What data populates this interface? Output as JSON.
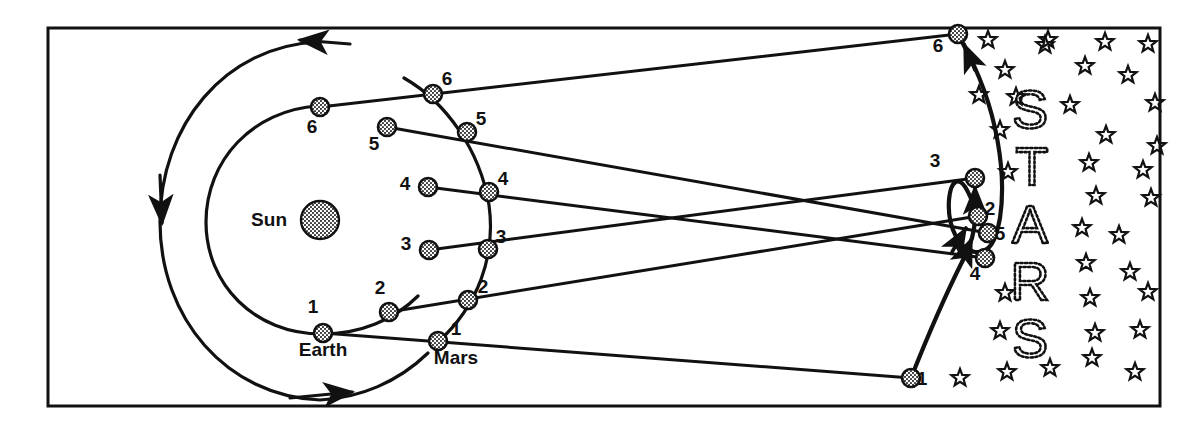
{
  "figure": {
    "title_visible": false,
    "frame": {
      "x": 48,
      "y": 28,
      "width": 1112,
      "height": 378,
      "stroke": "#111111",
      "stroke_width": 3,
      "fill": "#ffffff"
    },
    "colors": {
      "ink": "#111111",
      "body_fill": "#8c8c8c",
      "background": "#ffffff"
    }
  },
  "labels": {
    "sun": "Sun",
    "earth": "Earth",
    "mars": "Mars",
    "stars_word": [
      "S",
      "T",
      "A",
      "R",
      "S"
    ]
  },
  "sun": {
    "cx": 320,
    "cy": 220,
    "r": 19,
    "label_x": 287,
    "label_y": 226
  },
  "orbits": {
    "earth_orbit": {
      "cx": 320,
      "cy": 222,
      "rx": 145,
      "ry": 196,
      "note": "outer drawn arc - Earth path"
    },
    "mars_orbit": {
      "cx": 320,
      "cy": 222,
      "rx": 172,
      "ry": 200,
      "note": "inner-left large arc - Mars path"
    },
    "direction_arrows": [
      "top-left counterclockwise",
      "left-middle downward",
      "bottom rightward"
    ]
  },
  "earth_positions": [
    {
      "n": "1",
      "x": 323,
      "y": 333,
      "label_x": 313,
      "label_y": 313
    },
    {
      "n": "2",
      "x": 389,
      "y": 312,
      "label_x": 380,
      "label_y": 294
    },
    {
      "n": "3",
      "x": 429,
      "y": 250,
      "label_x": 406,
      "label_y": 250
    },
    {
      "n": "4",
      "x": 428,
      "y": 187,
      "label_x": 405,
      "label_y": 190
    },
    {
      "n": "5",
      "x": 387,
      "y": 127,
      "label_x": 374,
      "label_y": 150
    },
    {
      "n": "6",
      "x": 320,
      "y": 107,
      "label_x": 312,
      "label_y": 133
    }
  ],
  "mars_positions": [
    {
      "n": "1",
      "x": 438,
      "y": 341,
      "label_x": 456,
      "label_y": 335
    },
    {
      "n": "2",
      "x": 468,
      "y": 300,
      "label_x": 483,
      "label_y": 293
    },
    {
      "n": "3",
      "x": 488,
      "y": 249,
      "label_x": 501,
      "label_y": 243
    },
    {
      "n": "4",
      "x": 489,
      "y": 192,
      "label_x": 503,
      "label_y": 185
    },
    {
      "n": "5",
      "x": 467,
      "y": 132,
      "label_x": 481,
      "label_y": 125
    },
    {
      "n": "6",
      "x": 433,
      "y": 94,
      "label_x": 447,
      "label_y": 85
    }
  ],
  "apparent_positions": [
    {
      "n": "1",
      "x": 911,
      "y": 378,
      "filled": false,
      "label_x": 922,
      "label_y": 385
    },
    {
      "n": "2",
      "x": 978,
      "y": 216,
      "filled": false,
      "label_x": 990,
      "label_y": 215
    },
    {
      "n": "3",
      "x": 975,
      "y": 178,
      "filled": true,
      "label_x": 935,
      "label_y": 167
    },
    {
      "n": "4",
      "x": 985,
      "y": 258,
      "filled": true,
      "label_x": 975,
      "label_y": 280
    },
    {
      "n": "5",
      "x": 988,
      "y": 233,
      "filled": true,
      "label_x": 1000,
      "label_y": 240
    },
    {
      "n": "6",
      "x": 958,
      "y": 34,
      "filled": true,
      "label_x": 938,
      "label_y": 52
    }
  ],
  "sight_lines": [
    {
      "from": "earth-1",
      "to": "apparent-1",
      "x1": 323,
      "y1": 333,
      "x2": 911,
      "y2": 378
    },
    {
      "from": "earth-2",
      "to": "apparent-2",
      "x1": 389,
      "y1": 312,
      "x2": 978,
      "y2": 216
    },
    {
      "from": "earth-3",
      "to": "apparent-3",
      "x1": 429,
      "y1": 250,
      "x2": 975,
      "y2": 178
    },
    {
      "from": "earth-4",
      "to": "apparent-4",
      "x1": 428,
      "y1": 187,
      "x2": 985,
      "y2": 258
    },
    {
      "from": "earth-5",
      "to": "apparent-5",
      "x1": 387,
      "y1": 127,
      "x2": 988,
      "y2": 233
    },
    {
      "from": "earth-6",
      "to": "apparent-6",
      "x1": 320,
      "y1": 107,
      "x2": 958,
      "y2": 34
    }
  ],
  "apparent_path": {
    "label": "apparent path of Mars with retrograde loop",
    "d": "M 911,378 C 930,330 948,290 962,262 C 975,238 980,214 968,192 C 960,176 951,178 949,200 C 947,228 960,250 975,252 C 990,254 996,240 1000,218 C 1006,178 1000,110 962,42",
    "arrow_points": [
      "near 4 pointing up-right",
      "near 5 pointing up-right",
      "near 3 pointing up",
      "near 6 pointing up"
    ]
  },
  "stars_word_letters": [
    {
      "ch": "S",
      "x": 1030,
      "y": 128
    },
    {
      "ch": "T",
      "x": 1032,
      "y": 185
    },
    {
      "ch": "A",
      "x": 1030,
      "y": 243
    },
    {
      "ch": "R",
      "x": 1030,
      "y": 300
    },
    {
      "ch": "S",
      "x": 1030,
      "y": 357
    }
  ],
  "star_field": [
    {
      "x": 988,
      "y": 40
    },
    {
      "x": 1045,
      "y": 45
    },
    {
      "x": 1105,
      "y": 42
    },
    {
      "x": 1148,
      "y": 44
    },
    {
      "x": 1005,
      "y": 70
    },
    {
      "x": 1085,
      "y": 66
    },
    {
      "x": 1128,
      "y": 75
    },
    {
      "x": 1016,
      "y": 97
    },
    {
      "x": 1070,
      "y": 105
    },
    {
      "x": 1155,
      "y": 103
    },
    {
      "x": 979,
      "y": 95
    },
    {
      "x": 1106,
      "y": 135
    },
    {
      "x": 1157,
      "y": 146
    },
    {
      "x": 1000,
      "y": 130
    },
    {
      "x": 1089,
      "y": 163
    },
    {
      "x": 1143,
      "y": 170
    },
    {
      "x": 1008,
      "y": 172
    },
    {
      "x": 1096,
      "y": 196
    },
    {
      "x": 1151,
      "y": 198
    },
    {
      "x": 1082,
      "y": 228
    },
    {
      "x": 1119,
      "y": 235
    },
    {
      "x": 1005,
      "y": 293
    },
    {
      "x": 1086,
      "y": 263
    },
    {
      "x": 1130,
      "y": 272
    },
    {
      "x": 1090,
      "y": 298
    },
    {
      "x": 1148,
      "y": 292
    },
    {
      "x": 1000,
      "y": 331
    },
    {
      "x": 1095,
      "y": 333
    },
    {
      "x": 1140,
      "y": 330
    },
    {
      "x": 1007,
      "y": 372
    },
    {
      "x": 1050,
      "y": 368
    },
    {
      "x": 1092,
      "y": 358
    },
    {
      "x": 1135,
      "y": 372
    },
    {
      "x": 960,
      "y": 378
    },
    {
      "x": 1048,
      "y": 40
    }
  ]
}
